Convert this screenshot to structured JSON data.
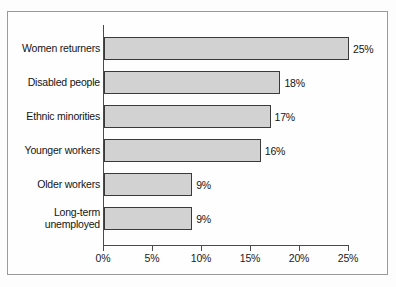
{
  "chart_data": {
    "type": "bar",
    "orientation": "horizontal",
    "title": "",
    "xlabel": "",
    "ylabel": "",
    "categories": [
      "Women returners",
      "Disabled people",
      "Ethnic minorities",
      "Younger workers",
      "Older workers",
      "Long-term unemployed"
    ],
    "values": [
      25,
      18,
      17,
      16,
      9,
      9
    ],
    "data_labels": [
      "25%",
      "18%",
      "17%",
      "16%",
      "9%",
      "9%"
    ],
    "xlim": [
      0,
      25
    ],
    "xticks": [
      0,
      5,
      10,
      15,
      20,
      25
    ],
    "xtick_labels": [
      "0%",
      "5%",
      "10%",
      "15%",
      "20%",
      "25%"
    ],
    "grid": false,
    "legend": false,
    "bar_fill_color": "#d2d2d2",
    "bar_edge_color": "#3a3a3a",
    "axis_color": "#4a4a4a",
    "frame_color": "#9a9a9a",
    "background_color": "#fefefe"
  },
  "rows": [
    {
      "label": "Women returners",
      "label_line1": "Women returners",
      "label_line2": "",
      "value_label": "25%"
    },
    {
      "label": "Disabled people",
      "label_line1": "Disabled people",
      "label_line2": "",
      "value_label": "18%"
    },
    {
      "label": "Ethnic minorities",
      "label_line1": "Ethnic minorities",
      "label_line2": "",
      "value_label": "17%"
    },
    {
      "label": "Younger workers",
      "label_line1": "Younger workers",
      "label_line2": "",
      "value_label": "16%"
    },
    {
      "label": "Older workers",
      "label_line1": "Older workers",
      "label_line2": "",
      "value_label": "9%"
    },
    {
      "label": "Long-term unemployed",
      "label_line1": "Long-term",
      "label_line2": "unemployed",
      "value_label": "9%"
    }
  ]
}
